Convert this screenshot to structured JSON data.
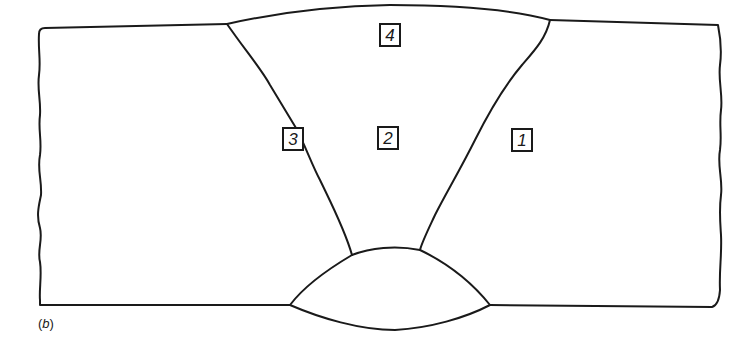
{
  "figure": {
    "caption_open": "(",
    "caption_letter": "b",
    "caption_close": ")",
    "line_color": "#1a1a1a",
    "background_color": "#ffffff"
  },
  "zones": [
    {
      "id": "1",
      "label": "1",
      "region": "base-metal-right"
    },
    {
      "id": "2",
      "label": "2",
      "region": "weld-metal-center"
    },
    {
      "id": "3",
      "label": "3",
      "region": "fusion-line-left"
    },
    {
      "id": "4",
      "label": "4",
      "region": "weld-crown"
    }
  ]
}
